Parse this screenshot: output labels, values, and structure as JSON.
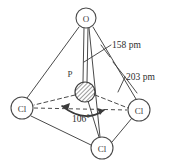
{
  "figure": {
    "colors": {
      "stroke": "#4a4a4a",
      "text": "#2e2e2e",
      "background": "#ffffff",
      "hatch": "#555555"
    },
    "atoms": [
      {
        "id": "oxygen-top",
        "label": "O",
        "cx": 86,
        "cy": 18,
        "r": 10
      },
      {
        "id": "chlorine-left",
        "label": "Cl",
        "cx": 22,
        "cy": 108,
        "r": 11
      },
      {
        "id": "chlorine-right",
        "label": "Cl",
        "cx": 139,
        "cy": 110,
        "r": 11
      },
      {
        "id": "chlorine-bottom",
        "label": "Cl",
        "cx": 102,
        "cy": 148,
        "r": 11
      },
      {
        "id": "phosphorus-center",
        "label": "P",
        "cx": 85,
        "cy": 92,
        "r": 10
      }
    ],
    "callouts": [
      {
        "id": "bond-length-o",
        "text": "158 pm",
        "x": 112,
        "y": 48
      },
      {
        "id": "bond-length-cl",
        "text": "203 pm",
        "x": 126,
        "y": 80
      }
    ],
    "angle": {
      "id": "bond-angle",
      "text": "106°",
      "x": 81,
      "y": 122
    }
  }
}
